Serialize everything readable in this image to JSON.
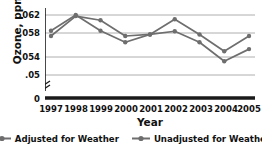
{
  "chart_data": {
    "type": "line",
    "title": "",
    "xlabel": "Year",
    "ylabel": "Ozone, ppm",
    "categories": [
      "1997",
      "1998",
      "1999",
      "2000",
      "2001",
      "2002",
      "2003",
      "2004",
      "2005"
    ],
    "x": [
      1997,
      1998,
      1999,
      2000,
      2001,
      2002,
      2003,
      2004,
      2005
    ],
    "series": [
      {
        "name": "Adjusted for Weather",
        "color": "#6e6e6e",
        "values": [
          0.059,
          0.062,
          0.059,
          0.0568,
          0.0583,
          0.0589,
          0.0568,
          0.0532,
          0.0555
        ]
      },
      {
        "name": "Unadjusted for Weather",
        "color": "#6e6e6e",
        "values": [
          0.058,
          0.0618,
          0.061,
          0.058,
          0.0583,
          0.0612,
          0.0583,
          0.0551,
          0.058
        ]
      }
    ],
    "ylim": [
      0.049,
      0.0635
    ],
    "yticks": [
      0.062,
      0.058,
      0.054,
      0.05
    ],
    "ytick_labels": [
      ".062",
      ".058",
      ".054",
      ".05"
    ],
    "zero_tick_label": "0",
    "axis_break": true,
    "grid": true,
    "grid_axis": "y",
    "legend_position": "bottom",
    "line_color": "#6e6e6e",
    "grid_color": "#9a9a9a",
    "axis_color": "#1a1a1a",
    "text_color": "#111111"
  },
  "legend": {
    "items": [
      {
        "label": "Adjusted for Weather"
      },
      {
        "label": "Unadjusted for Weather"
      }
    ]
  }
}
